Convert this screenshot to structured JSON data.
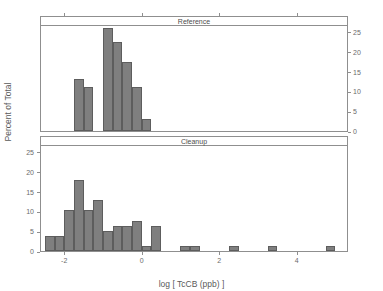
{
  "chart_data": {
    "type": "bar",
    "title": "",
    "xlabel": "log [ TcCB (ppb) ]",
    "ylabel": "Percent of Total",
    "grid": false,
    "legend": "none",
    "xlim": [
      -2.6,
      5.3
    ],
    "ylim": [
      0,
      27
    ],
    "xticks": [
      -2,
      0,
      2,
      4
    ],
    "xticklabels": [
      "-2",
      "0",
      "2",
      "4"
    ],
    "yticks": [
      0,
      5,
      10,
      15,
      20,
      25
    ],
    "yticklabels": [
      "0",
      "5",
      "10",
      "15",
      "20",
      "25"
    ],
    "bin_width": 0.25,
    "panels": [
      {
        "name": "Reference",
        "strip_label": "Reference",
        "axis_side": "right",
        "bins_left": [
          -1.75,
          -1.5,
          -1.25,
          -1.0,
          -0.75,
          -0.5,
          -0.25,
          0.0,
          0.25
        ],
        "values": [
          13.0,
          11.0,
          0.0,
          26.0,
          22.5,
          17.5,
          11.0,
          3.0,
          0.0
        ]
      },
      {
        "name": "Cleanup",
        "strip_label": "Cleanup",
        "axis_side": "left",
        "bins_left": [
          -2.5,
          -2.25,
          -2.0,
          -1.75,
          -1.5,
          -1.25,
          -1.0,
          -0.75,
          -0.5,
          -0.25,
          0.0,
          0.25,
          0.5,
          0.75,
          1.0,
          1.25,
          1.5,
          1.75,
          2.0,
          2.25,
          2.5,
          2.75,
          3.0,
          3.25,
          3.5,
          3.75,
          4.0,
          4.25,
          4.5,
          4.75,
          5.0
        ],
        "values": [
          3.8,
          3.8,
          10.3,
          18.0,
          10.3,
          12.8,
          5.1,
          6.4,
          6.4,
          7.7,
          1.3,
          6.4,
          0.0,
          0.0,
          1.3,
          1.3,
          0.0,
          0.0,
          0.0,
          1.3,
          0.0,
          0.0,
          0.0,
          1.3,
          0.0,
          0.0,
          0.0,
          0.0,
          0.0,
          1.3,
          0.0
        ]
      }
    ]
  },
  "axes": {
    "x_title": "log [ TcCB (ppb) ]",
    "y_title": "Percent of Total",
    "x_tick_labels": [
      "-2",
      "0",
      "2",
      "4"
    ],
    "y_tick_labels": [
      "0",
      "5",
      "10",
      "15",
      "20",
      "25"
    ]
  },
  "panels": {
    "reference_label": "Reference",
    "cleanup_label": "Cleanup"
  },
  "colors": {
    "bar_fill": "#7f7f7f",
    "bar_stroke": "#5d5d5d",
    "axis": "#8f8f8f",
    "text": "#5a5a5a"
  }
}
